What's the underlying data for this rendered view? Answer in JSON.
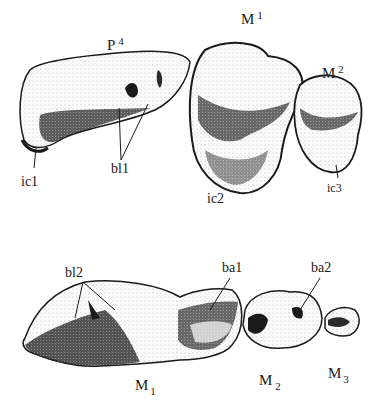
{
  "figure": {
    "upper_row": {
      "teeth": [
        {
          "id": "P4",
          "label": "P",
          "index": "4",
          "index_position": "superscript"
        },
        {
          "id": "M1_upper",
          "label": "M",
          "index": "1",
          "index_position": "superscript"
        },
        {
          "id": "M2_upper",
          "label": "M",
          "index": "2",
          "index_position": "superscript"
        }
      ],
      "annotations": [
        {
          "id": "ic1",
          "text": "ic1"
        },
        {
          "id": "bl1",
          "text": "bl1"
        },
        {
          "id": "ic2",
          "text": "ic2"
        },
        {
          "id": "ic3",
          "text": "ic3"
        }
      ]
    },
    "lower_row": {
      "teeth": [
        {
          "id": "M1_lower",
          "label": "M",
          "index": "1",
          "index_position": "subscript"
        },
        {
          "id": "M2_lower",
          "label": "M",
          "index": "2",
          "index_position": "subscript"
        },
        {
          "id": "M3_lower",
          "label": "M",
          "index": "3",
          "index_position": "subscript"
        }
      ],
      "annotations": [
        {
          "id": "bl2",
          "text": "bl2"
        },
        {
          "id": "ba1",
          "text": "ba1"
        },
        {
          "id": "ba2",
          "text": "ba2"
        }
      ]
    },
    "colors": {
      "ink": "#1a1a1a",
      "stipple": "#555555",
      "background": "#ffffff"
    }
  }
}
